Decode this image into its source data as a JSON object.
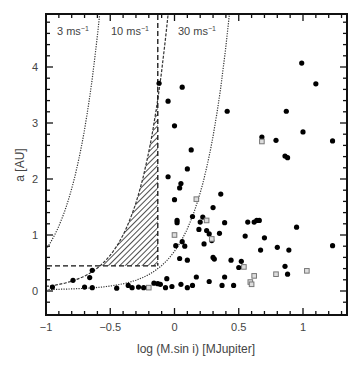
{
  "chart_data": {
    "type": "scatter",
    "title": "",
    "xlabel": "log (M.sin i) [MJupiter]",
    "ylabel": "a [AU]",
    "xlim": [
      -1.0,
      1.35
    ],
    "ylim": [
      -0.4,
      4.85
    ],
    "xticks": [
      -1,
      -0.5,
      0,
      0.5,
      1
    ],
    "xtick_labels": [
      "−1",
      "−0.5",
      "0",
      "0.5",
      "1"
    ],
    "yticks": [
      0,
      1,
      2,
      3,
      4
    ],
    "ytick_labels": [
      "0",
      "1",
      "2",
      "3",
      "4"
    ],
    "grid": false,
    "legend": null,
    "annotations": [
      {
        "text": "3 ms",
        "sup": "−1",
        "x": -0.93,
        "y": 4.55
      },
      {
        "text": "10 ms",
        "sup": "−1",
        "x": -0.5,
        "y": 4.55
      },
      {
        "text": "30 ms",
        "sup": "−1",
        "x": 0.0,
        "y": 4.55
      }
    ],
    "curves": [
      {
        "name": "3 ms-1 detection limit",
        "style": "dotted",
        "K": 3
      },
      {
        "name": "10 ms-1 detection limit",
        "style": "dashed",
        "K": 10
      },
      {
        "name": "30 ms-1 detection limit",
        "style": "dotted",
        "K": 30
      }
    ],
    "threshold_lines": {
      "a": 0.45,
      "log_m": -0.13,
      "style": "dashed"
    },
    "hatched_region": {
      "description": "Region between 10 ms-1 curve, a=0.45 AU and log M sin i = -0.13"
    },
    "series": [
      {
        "name": "Known planets",
        "marker": "filled-circle",
        "color": "#000000",
        "points": [
          [
            -0.12,
            3.71
          ],
          [
            0.06,
            3.64
          ],
          [
            -0.05,
            3.39
          ],
          [
            0.0,
            2.95
          ],
          [
            -0.05,
            2.04
          ],
          [
            0.41,
            3.21
          ],
          [
            0.99,
            4.07
          ],
          [
            1.1,
            3.7
          ],
          [
            0.87,
            3.21
          ],
          [
            1.0,
            2.84
          ],
          [
            0.79,
            2.69
          ],
          [
            1.23,
            2.68
          ],
          [
            0.86,
            2.41
          ],
          [
            0.88,
            2.38
          ],
          [
            0.68,
            2.75
          ],
          [
            0.0,
            1.63
          ],
          [
            0.22,
            1.32
          ],
          [
            0.14,
            1.33
          ],
          [
            0.3,
            1.49
          ],
          [
            0.62,
            1.23
          ],
          [
            0.95,
            1.14
          ],
          [
            0.05,
            1.92
          ],
          [
            0.36,
            1.73
          ],
          [
            0.13,
            2.52
          ],
          [
            0.1,
            2.18
          ],
          [
            0.04,
            1.84
          ],
          [
            0.64,
            1.26
          ],
          [
            0.55,
            0.98
          ],
          [
            0.57,
            1.23
          ],
          [
            0.66,
            1.26
          ],
          [
            0.7,
            0.95
          ],
          [
            0.8,
            0.78
          ],
          [
            0.67,
            0.73
          ],
          [
            0.89,
            0.73
          ],
          [
            1.23,
            0.81
          ],
          [
            0.52,
            0.53
          ],
          [
            0.86,
            0.44
          ],
          [
            0.88,
            0.3
          ],
          [
            0.2,
            1.23
          ],
          [
            0.25,
            1.08
          ],
          [
            0.27,
            1.02
          ],
          [
            0.19,
            1.1
          ],
          [
            0.35,
            1.03
          ],
          [
            0.39,
            1.22
          ],
          [
            0.29,
            0.9
          ],
          [
            0.23,
            0.84
          ],
          [
            0.08,
            0.8
          ],
          [
            0.06,
            0.88
          ],
          [
            0.1,
            0.55
          ],
          [
            0.3,
            0.6
          ],
          [
            0.31,
            0.57
          ],
          [
            0.27,
            0.17
          ],
          [
            0.39,
            0.25
          ],
          [
            0.37,
            0.1
          ],
          [
            0.17,
            0.25
          ],
          [
            0.14,
            0.1
          ],
          [
            0.46,
            0.1
          ],
          [
            0.44,
            0.55
          ],
          [
            0.5,
            0.42
          ],
          [
            -0.95,
            0.07
          ],
          [
            -0.79,
            0.19
          ],
          [
            -0.66,
            0.24
          ],
          [
            -0.64,
            0.37
          ],
          [
            -0.7,
            0.07
          ],
          [
            -0.64,
            0.06
          ],
          [
            -0.45,
            0.05
          ],
          [
            -0.36,
            0.1
          ],
          [
            -0.33,
            0.06
          ],
          [
            -0.28,
            0.07
          ],
          [
            -0.24,
            0.06
          ],
          [
            -0.16,
            0.14
          ],
          [
            -0.13,
            0.13
          ],
          [
            -0.11,
            0.12
          ],
          [
            -0.06,
            0.22
          ],
          [
            -0.02,
            0.08
          ],
          [
            0.01,
            0.81
          ],
          [
            0.02,
            1.22
          ],
          [
            0.02,
            1.26
          ],
          [
            0.04,
            0.58
          ],
          [
            0.05,
            0.12
          ],
          [
            -0.07,
            0.06
          ],
          [
            0.1,
            0.06
          ]
        ]
      },
      {
        "name": "Other candidates",
        "marker": "open-square",
        "color": "#777777",
        "points": [
          [
            0.17,
            1.64
          ],
          [
            0.25,
            1.26
          ],
          [
            0.29,
            0.93
          ],
          [
            0.0,
            1.0
          ],
          [
            0.54,
            0.43
          ],
          [
            0.62,
            0.27
          ],
          [
            0.59,
            0.16
          ],
          [
            0.6,
            0.12
          ],
          [
            0.79,
            0.3
          ],
          [
            1.03,
            0.36
          ],
          [
            -0.2,
            0.06
          ],
          [
            0.68,
            2.67
          ]
        ]
      }
    ]
  }
}
